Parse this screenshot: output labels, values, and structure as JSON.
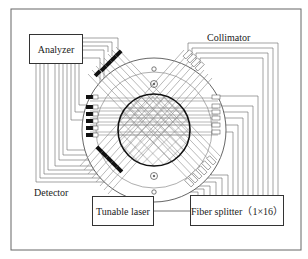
{
  "diagram": {
    "boxes": {
      "analyzer": "Analyzer",
      "tunable_laser": "Tunable laser",
      "fiber_splitter": "Fiber splitter（1×16）"
    },
    "labels": {
      "collimator": "Collimator",
      "detector": "Detector"
    },
    "colors": {
      "line": "#555555",
      "frame": "#666666",
      "detector_fill": "#111111",
      "background": "#ffffff"
    },
    "beam_groups": 4,
    "beams_per_group": 4,
    "splitter_channels": 16
  }
}
